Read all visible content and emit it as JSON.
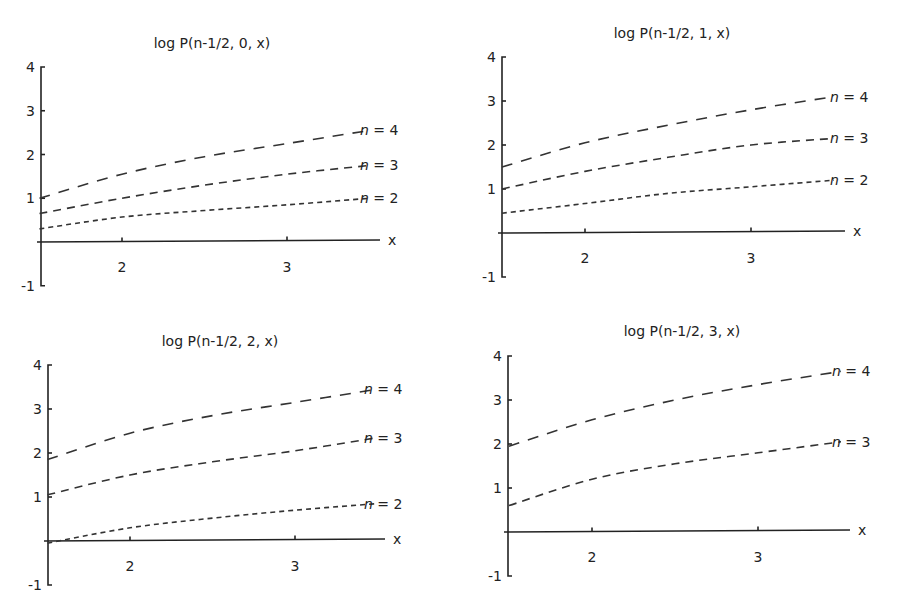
{
  "chart_data": [
    {
      "type": "line",
      "title": "log P(n-1/2, 0, x)",
      "xlabel": "x",
      "ylabel": "",
      "xlim": [
        1.5,
        3.55
      ],
      "ylim": [
        -1,
        4
      ],
      "xticks": [
        2,
        3
      ],
      "yticks": [
        -1,
        1,
        2,
        3,
        4
      ],
      "grid": false,
      "legend": "inline labels at right end of curves",
      "x": [
        1.5,
        2.0,
        2.5,
        3.0,
        3.5
      ],
      "series": [
        {
          "name": "n = 4",
          "values": [
            1.0,
            1.55,
            1.95,
            2.25,
            2.55
          ],
          "dash": "long"
        },
        {
          "name": "n = 3",
          "values": [
            0.65,
            1.0,
            1.3,
            1.55,
            1.75
          ],
          "dash": "medium"
        },
        {
          "name": "n = 2",
          "values": [
            0.3,
            0.57,
            0.72,
            0.85,
            1.0
          ],
          "dash": "short"
        }
      ]
    },
    {
      "type": "line",
      "title": "log P(n-1/2, 1, x)",
      "xlabel": "x",
      "ylabel": "",
      "xlim": [
        1.5,
        3.55
      ],
      "ylim": [
        -1,
        4
      ],
      "xticks": [
        2,
        3
      ],
      "yticks": [
        -1,
        1,
        2,
        3,
        4
      ],
      "grid": false,
      "legend": "inline labels at right end of curves",
      "x": [
        1.5,
        2.0,
        2.5,
        3.0,
        3.5
      ],
      "series": [
        {
          "name": "n = 4",
          "values": [
            1.5,
            2.05,
            2.45,
            2.8,
            3.1
          ],
          "dash": "long"
        },
        {
          "name": "n = 3",
          "values": [
            1.0,
            1.4,
            1.72,
            2.0,
            2.15
          ],
          "dash": "medium"
        },
        {
          "name": "n = 2",
          "values": [
            0.45,
            0.67,
            0.9,
            1.05,
            1.2
          ],
          "dash": "short"
        }
      ]
    },
    {
      "type": "line",
      "title": "log P(n-1/2, 2, x)",
      "xlabel": "x",
      "ylabel": "",
      "xlim": [
        1.5,
        3.55
      ],
      "ylim": [
        -1,
        4
      ],
      "xticks": [
        2,
        3
      ],
      "yticks": [
        -1,
        1,
        2,
        3,
        4
      ],
      "grid": false,
      "legend": "inline labels at right end of curves",
      "x": [
        1.5,
        2.0,
        2.5,
        3.0,
        3.5
      ],
      "series": [
        {
          "name": "n = 4",
          "values": [
            1.85,
            2.45,
            2.85,
            3.15,
            3.45
          ],
          "dash": "long"
        },
        {
          "name": "n = 3",
          "values": [
            1.05,
            1.5,
            1.8,
            2.05,
            2.35
          ],
          "dash": "medium"
        },
        {
          "name": "n = 2",
          "values": [
            -0.05,
            0.3,
            0.52,
            0.7,
            0.85
          ],
          "dash": "short"
        }
      ]
    },
    {
      "type": "line",
      "title": "log P(n-1/2, 3, x)",
      "xlabel": "x",
      "ylabel": "",
      "xlim": [
        1.5,
        3.55
      ],
      "ylim": [
        -1,
        4
      ],
      "xticks": [
        2,
        3
      ],
      "yticks": [
        -1,
        1,
        2,
        3,
        4
      ],
      "grid": false,
      "legend": "inline labels at right end of curves",
      "x": [
        1.5,
        2.0,
        2.5,
        3.0,
        3.5
      ],
      "series": [
        {
          "name": "n = 4",
          "values": [
            1.95,
            2.55,
            3.0,
            3.35,
            3.65
          ],
          "dash": "long"
        },
        {
          "name": "n = 3",
          "values": [
            0.6,
            1.2,
            1.55,
            1.8,
            2.05
          ],
          "dash": "medium"
        }
      ]
    }
  ],
  "panels": [
    {
      "title": "log P(n-1/2, 0, x)",
      "x_axis_label": "x",
      "x_ticks": [
        "2",
        "3"
      ],
      "y_ticks": [
        "4",
        "3",
        "2",
        "1",
        "-1"
      ],
      "labels": [
        {
          "n": "n",
          "rest": " = 4"
        },
        {
          "n": "n",
          "rest": " = 3"
        },
        {
          "n": "n",
          "rest": " = 2"
        }
      ]
    },
    {
      "title": "log P(n-1/2, 1, x)",
      "x_axis_label": "x",
      "x_ticks": [
        "2",
        "3"
      ],
      "y_ticks": [
        "4",
        "3",
        "2",
        "1",
        "-1"
      ],
      "labels": [
        {
          "n": "n",
          "rest": " = 4"
        },
        {
          "n": "n",
          "rest": " = 3"
        },
        {
          "n": "n",
          "rest": " = 2"
        }
      ]
    },
    {
      "title": "log P(n-1/2, 2, x)",
      "x_axis_label": "x",
      "x_ticks": [
        "2",
        "3"
      ],
      "y_ticks": [
        "4",
        "3",
        "2",
        "1",
        "-1"
      ],
      "labels": [
        {
          "n": "n",
          "rest": " = 4"
        },
        {
          "n": "n",
          "rest": " = 3"
        },
        {
          "n": "n",
          "rest": " = 2"
        }
      ]
    },
    {
      "title": "log P(n-1/2, 3, x)",
      "x_axis_label": "x",
      "x_ticks": [
        "2",
        "3"
      ],
      "y_ticks": [
        "4",
        "3",
        "2",
        "1",
        "-1"
      ],
      "labels": [
        {
          "n": "n",
          "rest": " = 4"
        },
        {
          "n": "n",
          "rest": " = 3"
        }
      ]
    }
  ]
}
